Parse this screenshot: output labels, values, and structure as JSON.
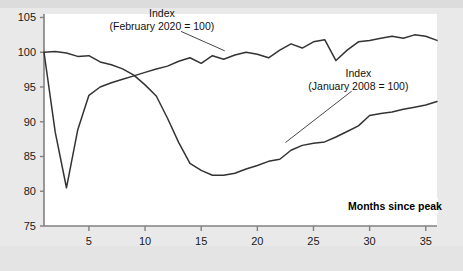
{
  "figure": {
    "background_color": "#e9e9e9",
    "plot_background_color": "#ffffff",
    "line_color": "#333333",
    "axis_color": "#808080",
    "text_color": "#111111"
  },
  "labels": {
    "xaxis_title": "Months since peak",
    "annotation_covid_line1": "Index",
    "annotation_covid_line2": "(February 2020 = 100)",
    "annotation_gfc_line1": "Index",
    "annotation_gfc_line2": "(January 2008 = 100)"
  },
  "chart_data": {
    "type": "line",
    "title": "",
    "xlabel": "Months since peak",
    "ylabel": "",
    "xlim": [
      1,
      36
    ],
    "ylim": [
      75,
      105.5
    ],
    "xticks": [
      5,
      10,
      15,
      20,
      25,
      30,
      35
    ],
    "yticks": [
      75,
      80,
      85,
      90,
      95,
      100,
      105
    ],
    "xtick_labels": [
      "5",
      "10",
      "15",
      "20",
      "25",
      "30",
      "35"
    ],
    "ytick_labels": [
      "75",
      "80",
      "85",
      "90",
      "95",
      "100",
      "105"
    ],
    "grid": false,
    "legend": "annotations",
    "x": [
      1,
      2,
      3,
      4,
      5,
      6,
      7,
      8,
      9,
      10,
      11,
      12,
      13,
      14,
      15,
      16,
      17,
      18,
      19,
      20,
      21,
      22,
      23,
      24,
      25,
      26,
      27,
      28,
      29,
      30,
      31,
      32,
      33,
      34,
      35,
      36
    ],
    "series": [
      {
        "name": "Index (February 2020 = 100)",
        "annotation": "Index (February 2020 = 100)",
        "values": [
          100.0,
          88.5,
          80.5,
          88.8,
          93.8,
          95.0,
          95.6,
          96.1,
          96.6,
          97.1,
          97.6,
          98.0,
          98.7,
          99.2,
          98.4,
          99.5,
          99.0,
          99.6,
          100.0,
          99.7,
          99.2,
          100.3,
          101.2,
          100.6,
          101.5,
          101.8,
          98.8,
          100.3,
          101.5,
          101.7,
          102.0,
          102.3,
          102.0,
          102.5,
          102.3,
          101.7
        ]
      },
      {
        "name": "Index (January 2008 = 100)",
        "annotation": "Index (January 2008 = 100)",
        "values": [
          100.0,
          100.1,
          99.9,
          99.4,
          99.5,
          98.6,
          98.2,
          97.6,
          96.7,
          95.3,
          93.7,
          90.5,
          87.0,
          84.0,
          83.0,
          82.3,
          82.3,
          82.6,
          83.2,
          83.7,
          84.3,
          84.6,
          85.9,
          86.6,
          86.9,
          87.1,
          87.8,
          88.6,
          89.4,
          90.9,
          91.2,
          91.4,
          91.8,
          92.1,
          92.4,
          92.9
        ]
      }
    ],
    "annotations": [
      {
        "text_line1": "Index",
        "text_line2": "(February 2020 = 100)",
        "text_x": 11.5,
        "text_y": 105.0,
        "leader_from_x": 13.2,
        "leader_from_y": 103.0,
        "leader_to_x": 17.1,
        "leader_to_y": 100.2
      },
      {
        "text_line1": "Index",
        "text_line2": "(January 2008 = 100)",
        "text_x": 29.0,
        "text_y": 96.5,
        "leader_from_x": 28.4,
        "leader_from_y": 94.4,
        "leader_to_x": 22.5,
        "leader_to_y": 87.0
      }
    ]
  }
}
